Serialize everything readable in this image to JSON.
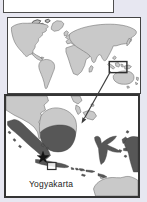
{
  "figure": {
    "type": "locator-map",
    "world": {
      "highlight_box": "indonesia-highlight-rect"
    },
    "inset": {
      "label": "Yogyakarta",
      "marker_icon": "star-icon"
    },
    "colors": {
      "background": "#e7e7f1",
      "panel": "#ffffff",
      "border": "#3f3f3f",
      "land-light": "#c9c9c9",
      "land-outline": "#6b6b6b",
      "land-dark": "#575757",
      "marker": "#141414",
      "arrow": "#3d3d3d",
      "label": "#1d1d1d"
    }
  }
}
